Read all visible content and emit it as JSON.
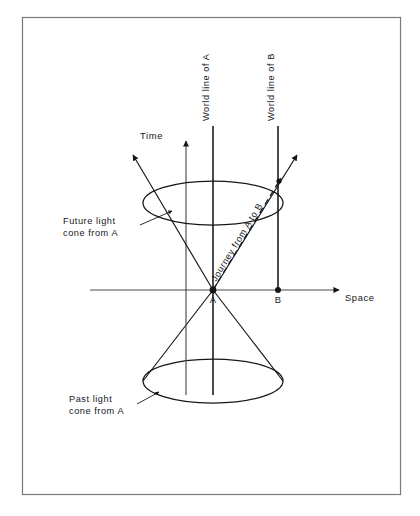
{
  "figure": {
    "type": "spacetime-light-cone-diagram",
    "border_color": "#6e6e6e",
    "ink_color": "#15161a",
    "background": "#ffffff",
    "border": {
      "x": 22,
      "y": 17,
      "width": 378,
      "height": 477
    }
  },
  "axes": {
    "time": {
      "label": "Time",
      "label_x": 163,
      "label_y": 136,
      "axis_x": 186,
      "top_y": 140,
      "bottom_y": 395
    },
    "space": {
      "label": "Space",
      "label_x": 345,
      "label_y": 299,
      "axis_y": 290,
      "left_x": 90,
      "right_x": 341
    }
  },
  "events": [
    {
      "name": "A",
      "label": "A",
      "x": 213,
      "y": 290,
      "label_x": 209,
      "label_y": 302
    },
    {
      "name": "B",
      "label": "B",
      "x": 278,
      "y": 290,
      "label_x": 274,
      "label_y": 302
    }
  ],
  "worldlines": [
    {
      "name": "world-line-a",
      "label": "World line of A",
      "x": 213,
      "top_y": 125,
      "bottom_y": 395,
      "label_x": 209,
      "label_y": 121
    },
    {
      "name": "world-line-b",
      "label": "World line of B",
      "x": 278,
      "top_y": 125,
      "bottom_y": 290,
      "label_x": 274,
      "label_y": 121
    }
  ],
  "cones": {
    "future": {
      "label_line1": "Future light",
      "label_line2": "cone from A",
      "label_x": 63,
      "label_y": 228,
      "apex_x": 213,
      "apex_y": 290,
      "ellipse_cx": 213,
      "ellipse_cy": 203,
      "ellipse_rx": 70,
      "ellipse_ry": 22,
      "leader_from": [
        147,
        224
      ],
      "leader_to": [
        171,
        212
      ]
    },
    "past": {
      "label_line1": "Past light",
      "label_line2": "cone from A",
      "label_x": 69,
      "label_y": 406,
      "apex_x": 213,
      "apex_y": 290,
      "ellipse_cx": 213,
      "ellipse_cy": 381,
      "ellipse_rx": 70,
      "ellipse_ry": 22,
      "leader_from": [
        141,
        404
      ],
      "leader_to": [
        160,
        394
      ]
    }
  },
  "journey": {
    "label": "Journey from A to B",
    "from_event": "A",
    "to_event": "B",
    "start": [
      213,
      290
    ],
    "end": [
      278,
      184
    ],
    "style": "dashed"
  },
  "light_rays": [
    {
      "name": "future-ray-left",
      "from": [
        213,
        290
      ],
      "to": [
        130,
        152
      ]
    },
    {
      "name": "future-ray-right",
      "from": [
        213,
        290
      ],
      "to": [
        300,
        152
      ]
    },
    {
      "name": "past-ray-left",
      "from": [
        213,
        290
      ],
      "to": [
        143,
        381
      ]
    },
    {
      "name": "past-ray-right",
      "from": [
        213,
        290
      ],
      "to": [
        283,
        381
      ]
    }
  ],
  "caption": {
    "text": "figure caption (cropped at image edge)",
    "visible": false
  }
}
